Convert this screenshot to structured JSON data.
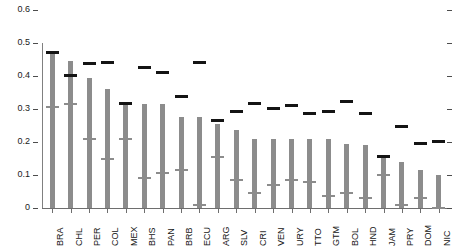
{
  "chart_data": {
    "type": "bar",
    "title": "",
    "subtitle": "",
    "xlabel": "",
    "ylabel": "",
    "ylim": [
      0,
      0.6
    ],
    "grid": false,
    "legend_position": "none",
    "ytick_labels": [
      "0.6",
      "0.5",
      "0.4",
      "0.3",
      "0.2",
      "0.1",
      "0"
    ],
    "ytick_values": [
      0.6,
      0.5,
      0.4,
      0.3,
      0.2,
      0.1,
      0
    ],
    "right_axis_ticks": [
      0.6,
      0.5,
      0.4,
      0.3,
      0.2,
      0.1,
      0
    ],
    "categories": [
      "BRA",
      "CHL",
      "PER",
      "COL",
      "MEX",
      "BHS",
      "PAN",
      "BRB",
      "ECU",
      "ARG",
      "SLV",
      "CRI",
      "VEN",
      "URY",
      "TTO",
      "GTM",
      "BOL",
      "HND",
      "JAM",
      "PRY",
      "DOM",
      "NIC"
    ],
    "series": [
      {
        "name": "bar",
        "values": [
          0.47,
          0.445,
          0.395,
          0.36,
          0.315,
          0.315,
          0.315,
          0.275,
          0.275,
          0.255,
          0.235,
          0.21,
          0.21,
          0.21,
          0.21,
          0.21,
          0.195,
          0.19,
          0.155,
          0.14,
          0.115,
          0.1
        ]
      },
      {
        "name": "upper-marker",
        "values": [
          0.47,
          0.4,
          0.435,
          0.44,
          0.315,
          0.425,
          0.41,
          0.335,
          0.44,
          0.265,
          0.29,
          0.315,
          0.3,
          0.31,
          0.285,
          0.29,
          0.32,
          0.285,
          0.155,
          0.245,
          0.195,
          0.2
        ]
      },
      {
        "name": "mid-marker",
        "values": [
          0.305,
          0.315,
          0.21,
          0.15,
          0.21,
          0.09,
          0.105,
          0.115,
          0.01,
          0.155,
          0.085,
          0.045,
          0.07,
          0.085,
          0.08,
          0.035,
          0.045,
          0.03,
          0.1,
          0.01,
          0.03,
          0.0
        ]
      }
    ]
  }
}
